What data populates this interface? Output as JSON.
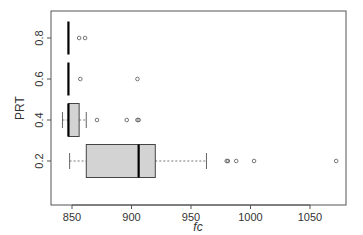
{
  "chart_data": {
    "type": "boxplot",
    "orientation": "horizontal",
    "title": "",
    "xlabel": "fc",
    "ylabel": "PRT",
    "xlim": [
      832,
      1077
    ],
    "ylim": [
      0.1,
      0.92
    ],
    "x_ticks": [
      850,
      900,
      950,
      1000,
      1050
    ],
    "x_tick_labels": [
      "850",
      "900",
      "950",
      "1000",
      "1050"
    ],
    "y_ticks": [
      0.2,
      0.4,
      0.6,
      0.8
    ],
    "y_tick_labels": [
      "0.2",
      "0.4",
      "0.6",
      "0.8"
    ],
    "grid": false,
    "legend": null,
    "box_fill": "#d3d3d3",
    "groups": [
      {
        "name": "0.2",
        "y": 0.2,
        "whisker_low": 848,
        "q1": 862,
        "median": 906,
        "q3": 920,
        "whisker_high": 963,
        "outliers": [
          980,
          981,
          988,
          1003,
          1072
        ]
      },
      {
        "name": "0.4",
        "y": 0.4,
        "whisker_low": 842,
        "q1": 847,
        "median": 847,
        "q3": 856,
        "whisker_high": 862,
        "outliers": [
          871,
          896,
          905,
          906
        ]
      },
      {
        "name": "0.6",
        "y": 0.6,
        "whisker_low": 847,
        "q1": 847,
        "median": 847,
        "q3": 847,
        "whisker_high": 847,
        "outliers": [
          857,
          905
        ]
      },
      {
        "name": "0.8",
        "y": 0.8,
        "whisker_low": 847,
        "q1": 847,
        "median": 847,
        "q3": 847,
        "whisker_high": 847,
        "outliers": [
          856,
          861
        ]
      }
    ]
  }
}
